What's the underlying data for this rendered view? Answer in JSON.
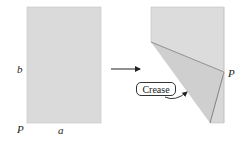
{
  "diagram": {
    "left_panel": {
      "description": "Unfolded rectangular sheet",
      "label_height": "b",
      "label_width": "a",
      "label_corner": "P",
      "fill": "#d9d9d9"
    },
    "arrow": {
      "direction": "right"
    },
    "right_panel": {
      "description": "Sheet folded so corner P touches the right edge",
      "label_point": "P",
      "crease_label": "Crease",
      "fill_top": "#dcdcdc",
      "fill_flap": "#cfcfcf",
      "edge_color": "#8a8a8a"
    }
  }
}
